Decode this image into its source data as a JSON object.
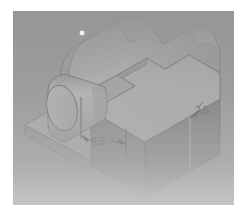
{
  "panel": {
    "background_color": "#9d9d9d",
    "frame_color": "#ffffff"
  },
  "model": {
    "title": "Isometric machined block with cylindrical boss",
    "faces": {
      "top_color": "#c9c9c9",
      "front_color": "#6e6e6e",
      "right_color": "#5f5f5f",
      "side_color": "#b4b4b4",
      "cylinder_light": "#d3d3d3",
      "cylinder_dark": "#8e8e8e",
      "edge_color": "#3c3c3c"
    }
  },
  "annotations": {
    "dimensions": [
      {
        "id": "height-dimension",
        "label": "2,5",
        "x": 182,
        "y": 100
      },
      {
        "id": "offset-dimension",
        "label": "8.5",
        "x": 78,
        "y": 141
      }
    ]
  },
  "cursor": {
    "label": "cursor-dot"
  }
}
